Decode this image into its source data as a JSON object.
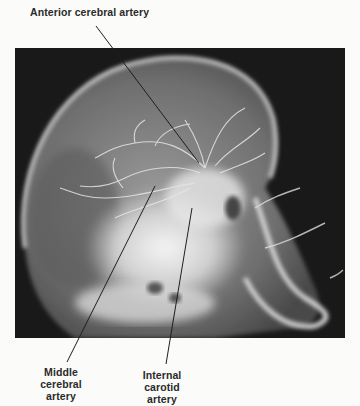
{
  "figure": {
    "labels": [
      {
        "id": "anterior",
        "text": "Anterior cerebral artery"
      },
      {
        "id": "middle",
        "text": "Middle\ncerebral\nartery",
        "lines": [
          "Middle",
          "cerebral",
          "artery"
        ]
      },
      {
        "id": "internal",
        "text": "Internal\ncarotid\nartery",
        "lines": [
          "Internal",
          "carotid",
          "artery"
        ]
      }
    ]
  }
}
